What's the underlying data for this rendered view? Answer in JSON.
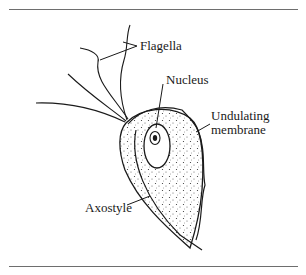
{
  "figure": {
    "type": "labeled-diagram",
    "labels": {
      "flagella": "Flagella",
      "nucleus": "Nucleus",
      "undulating_membrane_line1": "Undulating",
      "undulating_membrane_line2": "membrane",
      "axostyle": "Axostyle"
    }
  }
}
